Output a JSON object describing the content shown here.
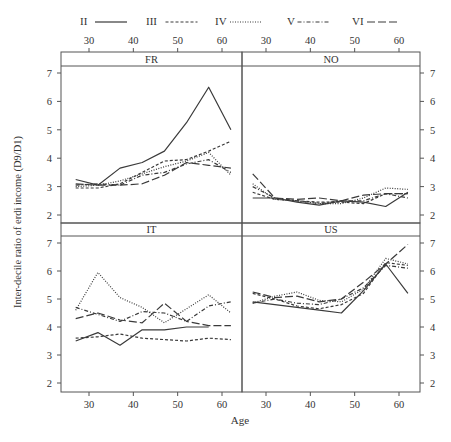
{
  "chart_data": {
    "type": "line",
    "title": "",
    "xlabel": "Age",
    "ylabel": "Inter-decile ratio of erdi income (D9/D1)",
    "xlim": [
      25,
      64
    ],
    "ylim": [
      1.5,
      7.3
    ],
    "x_ticks": [
      30,
      40,
      50,
      60
    ],
    "y_ticks": [
      2,
      3,
      4,
      5,
      6,
      7
    ],
    "grid": false,
    "legend_position": "top",
    "legend": [
      {
        "name": "II",
        "style": "solid"
      },
      {
        "name": "III",
        "style": "dashed-short"
      },
      {
        "name": "IV",
        "style": "dotted"
      },
      {
        "name": "V",
        "style": "dash-dot"
      },
      {
        "name": "VI",
        "style": "dashed-long"
      }
    ],
    "x": [
      27,
      32,
      37,
      42,
      47,
      52,
      57,
      62
    ],
    "panels": [
      {
        "name": "FR",
        "series": [
          {
            "name": "II",
            "values": [
              3.25,
              3.05,
              3.65,
              3.85,
              4.25,
              5.25,
              6.5,
              5.0
            ]
          },
          {
            "name": "III",
            "values": [
              2.95,
              2.95,
              3.1,
              3.5,
              3.9,
              3.95,
              4.25,
              4.6
            ]
          },
          {
            "name": "IV",
            "values": [
              3.0,
              3.05,
              3.2,
              3.45,
              3.7,
              3.9,
              4.2,
              3.4
            ]
          },
          {
            "name": "V",
            "values": [
              3.05,
              3.1,
              3.05,
              3.4,
              3.5,
              3.8,
              3.95,
              3.5
            ]
          },
          {
            "name": "VI",
            "values": [
              3.1,
              3.05,
              3.05,
              3.1,
              3.4,
              3.85,
              3.75,
              3.65
            ]
          }
        ]
      },
      {
        "name": "NO",
        "series": [
          {
            "name": "II",
            "values": [
              2.6,
              2.6,
              2.45,
              2.35,
              2.5,
              2.45,
              2.3,
              2.8
            ]
          },
          {
            "name": "III",
            "values": [
              2.8,
              2.55,
              2.5,
              2.45,
              2.45,
              2.4,
              2.75,
              2.75
            ]
          },
          {
            "name": "IV",
            "values": [
              3.1,
              2.55,
              2.5,
              2.4,
              2.4,
              2.6,
              2.95,
              2.9
            ]
          },
          {
            "name": "V",
            "values": [
              3.0,
              2.6,
              2.5,
              2.4,
              2.5,
              2.5,
              2.75,
              2.6
            ]
          },
          {
            "name": "VI",
            "values": [
              3.45,
              2.6,
              2.55,
              2.6,
              2.5,
              2.7,
              2.75,
              2.75
            ]
          }
        ]
      },
      {
        "name": "IT",
        "series": [
          {
            "name": "II",
            "values": [
              3.5,
              3.8,
              3.35,
              3.9,
              3.9,
              4.0,
              4.0
            ]
          },
          {
            "name": "III",
            "values": [
              3.6,
              3.65,
              3.75,
              3.6,
              3.55,
              3.5,
              3.6,
              3.55
            ]
          },
          {
            "name": "IV",
            "values": [
              4.6,
              5.95,
              5.05,
              4.7,
              4.15,
              4.65,
              5.15,
              4.5
            ]
          },
          {
            "name": "V",
            "values": [
              4.7,
              4.45,
              4.2,
              4.55,
              4.5,
              4.2,
              4.75,
              4.9
            ]
          },
          {
            "name": "VI",
            "values": [
              4.3,
              4.5,
              4.25,
              4.15,
              4.85,
              4.2,
              4.05,
              4.05
            ]
          }
        ]
      },
      {
        "name": "US",
        "series": [
          {
            "name": "II",
            "values": [
              4.9,
              4.8,
              4.7,
              4.6,
              4.5,
              5.3,
              6.25,
              5.2
            ]
          },
          {
            "name": "III",
            "values": [
              5.2,
              5.0,
              4.75,
              4.65,
              4.8,
              5.2,
              6.3,
              6.2
            ]
          },
          {
            "name": "IV",
            "values": [
              4.85,
              5.1,
              5.25,
              4.95,
              4.9,
              5.35,
              6.45,
              6.25
            ]
          },
          {
            "name": "V",
            "values": [
              4.85,
              5.0,
              4.85,
              4.8,
              5.0,
              5.4,
              6.2,
              6.1
            ]
          },
          {
            "name": "VI",
            "values": [
              5.25,
              5.05,
              5.1,
              4.9,
              5.0,
              5.6,
              6.25,
              6.95
            ]
          }
        ]
      }
    ]
  },
  "labels": {
    "panel_FR": "FR",
    "panel_NO": "NO",
    "panel_IT": "IT",
    "panel_US": "US",
    "xlabel": "Age",
    "ylabel": "Inter-decile ratio of erdi income (D9/D1)"
  },
  "colors": {
    "line": "#3a3a3a",
    "frame": "#555555",
    "text": "#333333",
    "background": "#ffffff"
  }
}
